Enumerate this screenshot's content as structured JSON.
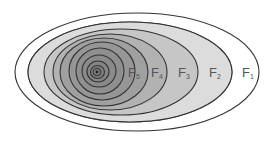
{
  "diagram": {
    "labels": [
      {
        "main": "F",
        "sub": "1"
      },
      {
        "main": "F",
        "sub": "2"
      },
      {
        "main": "F",
        "sub": "3"
      },
      {
        "main": "F",
        "sub": "4"
      },
      {
        "main": "F",
        "sub": "5"
      }
    ],
    "colors": {
      "background": "#ffffff",
      "stroke": "#333333",
      "f1": "#ffffff",
      "f2": "#dcdcdc",
      "f3": "#c6c6c6",
      "f4": "#b2b2b2",
      "f5": "#a0a0a0",
      "inner": "#8f8f8f"
    }
  }
}
